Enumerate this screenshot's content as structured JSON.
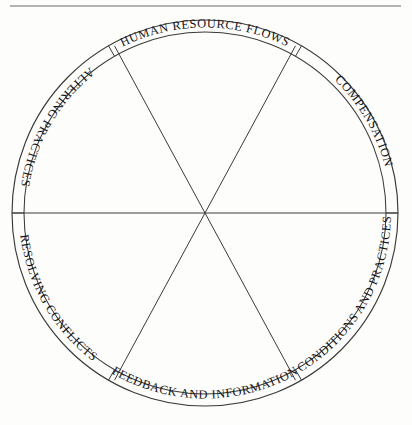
{
  "figure": {
    "shape": "circle",
    "sector_count": 6,
    "colors": {
      "background": "#fdfdfb",
      "stroke": "#3a3a38",
      "text": "#16161a",
      "top_rule": "#6b6b68"
    },
    "geometry": {
      "center_x": 205,
      "center_y": 213,
      "outer_radius": 193,
      "inner_radius": 181,
      "ring_width": 12
    },
    "top_rule": {
      "x1": 10,
      "x2": 401,
      "y": 6
    }
  },
  "sectors": [
    {
      "id": "human-resource-flows",
      "label": "HUMAN RESOURCE FLOWS",
      "position": "top",
      "start_angle_deg": -120,
      "end_angle_deg": -60,
      "text_flipped": false
    },
    {
      "id": "compensation",
      "label": "COMPENSATION",
      "position": "upper-right",
      "start_angle_deg": -60,
      "end_angle_deg": 0,
      "text_flipped": false
    },
    {
      "id": "conditions-and-practices",
      "label": "CONDITIONS AND PRACTICES",
      "position": "lower-right",
      "start_angle_deg": 0,
      "end_angle_deg": 60,
      "text_flipped": true
    },
    {
      "id": "feedback-and-information",
      "label": "FEEDBACK AND INFORMATION",
      "position": "bottom",
      "start_angle_deg": 60,
      "end_angle_deg": 120,
      "text_flipped": true
    },
    {
      "id": "resolving-conflicts",
      "label": "RESOLVING CONFLICTS",
      "position": "lower-left",
      "start_angle_deg": 120,
      "end_angle_deg": 180,
      "text_flipped": true
    },
    {
      "id": "altering-practices",
      "label": "ALTERING PRACTICES",
      "position": "upper-left",
      "start_angle_deg": 180,
      "end_angle_deg": 240,
      "text_flipped": true
    }
  ]
}
